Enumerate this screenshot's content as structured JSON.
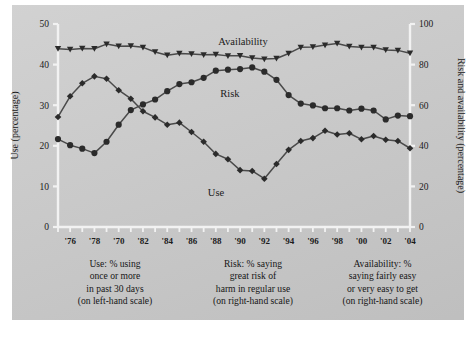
{
  "figure": {
    "background_color": "#c9c9c9",
    "page_color": "#ffffff",
    "line_color": "#4a4a4a",
    "marker_color": "#2b2b2b",
    "axis_color": "#f2f2f2"
  },
  "axes": {
    "left": {
      "label": "Use (percentage)",
      "ticks": [
        "0",
        "10",
        "20",
        "30",
        "40",
        "50"
      ],
      "min": 0,
      "max": 50
    },
    "right": {
      "label": "Risk and availability (percentage)",
      "ticks": [
        "0",
        "20",
        "40",
        "60",
        "80",
        "100"
      ],
      "min": 0,
      "max": 100
    },
    "x": {
      "tick_labels": [
        "'76",
        "'78",
        "'70",
        "'82",
        "'84",
        "'86",
        "'88",
        "'90",
        "'92",
        "'94",
        "'96",
        "'98",
        "'00",
        "'02",
        "'04"
      ],
      "min": 1975,
      "max": 2004
    }
  },
  "series_labels": {
    "availability": "Availability",
    "risk": "Risk",
    "use": "Use"
  },
  "captions": {
    "use": [
      "Use: % using",
      "once or more",
      "in past 30 days",
      "(on left-hand scale)"
    ],
    "risk": [
      "Risk: % saying",
      "great risk of",
      "harm in regular use",
      "(on right-hand scale)"
    ],
    "availability": [
      "Availability: %",
      "saying fairly easy",
      "or very easy to get",
      "(on right-hand scale)"
    ]
  },
  "chart_data": {
    "type": "line",
    "title": "",
    "xlabel": "",
    "ylabel": "Use (percentage)",
    "y2label": "Risk and availability (percentage)",
    "ylim": [
      0,
      50
    ],
    "y2lim": [
      0,
      100
    ],
    "xlim": [
      1975,
      2004
    ],
    "grid": false,
    "legend": "in-plot labels",
    "x": [
      1975,
      1976,
      1977,
      1978,
      1979,
      1980,
      1981,
      1982,
      1983,
      1984,
      1985,
      1986,
      1987,
      1988,
      1989,
      1990,
      1991,
      1992,
      1993,
      1994,
      1995,
      1996,
      1997,
      1998,
      1999,
      2000,
      2001,
      2002,
      2003,
      2004
    ],
    "series": [
      {
        "name": "Use",
        "axis": "left",
        "marker": "diamond",
        "values": [
          27.1,
          32.2,
          35.4,
          37.1,
          36.5,
          33.7,
          31.6,
          28.5,
          27.0,
          25.2,
          25.7,
          23.4,
          21.0,
          18.0,
          16.7,
          14.0,
          13.8,
          11.9,
          15.5,
          19.0,
          21.2,
          21.9,
          23.7,
          22.8,
          23.1,
          21.6,
          22.4,
          21.5,
          21.2,
          19.4
        ]
      },
      {
        "name": "Risk",
        "axis": "right",
        "marker": "circle",
        "values": [
          43.3,
          40.3,
          38.6,
          36.4,
          42.0,
          50.4,
          57.6,
          60.4,
          62.8,
          66.9,
          70.4,
          71.3,
          73.5,
          77.0,
          77.5,
          77.8,
          78.6,
          76.5,
          72.5,
          65.0,
          60.8,
          59.9,
          58.5,
          58.5,
          57.4,
          58.3,
          57.4,
          53.0,
          54.9,
          54.6
        ]
      },
      {
        "name": "Availability",
        "axis": "right",
        "marker": "triangle",
        "values": [
          87.8,
          87.4,
          87.9,
          87.8,
          90.1,
          89.0,
          89.2,
          88.5,
          86.2,
          84.6,
          85.5,
          85.2,
          84.8,
          85.0,
          84.3,
          84.4,
          83.3,
          82.7,
          83.0,
          85.5,
          88.5,
          88.7,
          89.6,
          90.4,
          88.9,
          88.5,
          88.5,
          87.2,
          87.0,
          85.6
        ]
      }
    ]
  }
}
